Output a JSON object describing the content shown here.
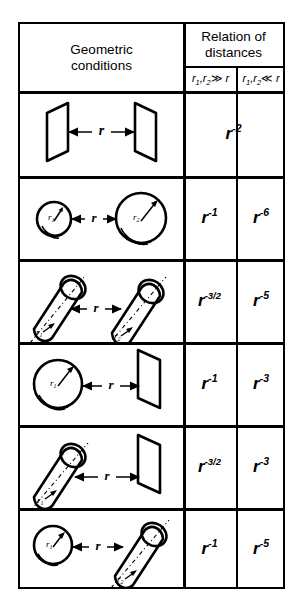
{
  "table": {
    "header": {
      "left_col_line1": "Geometric",
      "left_col_line2": "conditions",
      "right_col_line1": "Relation of",
      "right_col_line2": "distances",
      "sub_col_far": "r₁,r₂ ≫ r",
      "sub_col_near": "r₁,r₂ ≪ r",
      "sub_col_far_parts": {
        "r1": "r",
        "s1": "1",
        "r2": "r",
        "s2": "2",
        "rel": "≫",
        "r": "r"
      },
      "sub_col_near_parts": {
        "r1": "r",
        "s1": "1",
        "r2": "r",
        "s2": "2",
        "rel": "≪",
        "r": "r"
      }
    },
    "rows": [
      {
        "geometry": "plane-plane",
        "geometry_label": "two parallel planes separated by distance r",
        "distance_label": "r",
        "far_base": "r",
        "far_exp": "-2",
        "near_base": "r",
        "near_exp": "-2",
        "merged": true
      },
      {
        "geometry": "sphere-sphere",
        "geometry_label": "two spheres of radii r₁ and r₂ separated by distance r",
        "distance_label": "r",
        "radius_label_1": "r",
        "radius_sub_1": "1",
        "radius_label_2": "r",
        "radius_sub_2": "2",
        "far_base": "r",
        "far_exp": "-1",
        "near_base": "r",
        "near_exp": "-6",
        "merged": false
      },
      {
        "geometry": "cylinder-cylinder",
        "geometry_label": "two parallel cylinders of radii r₁ and r₂ separated by distance r",
        "distance_label": "r",
        "radius_label_1": "r",
        "radius_sub_1": "1",
        "radius_label_2": "r",
        "radius_sub_2": "2",
        "far_base": "r",
        "far_exp": "-3/2",
        "near_base": "r",
        "near_exp": "-5",
        "merged": false
      },
      {
        "geometry": "sphere-plane",
        "geometry_label": "sphere of radius r₁ and a plane separated by distance r",
        "distance_label": "r",
        "radius_label_1": "r",
        "radius_sub_1": "1",
        "far_base": "r",
        "far_exp": "-1",
        "near_base": "r",
        "near_exp": "-3",
        "merged": false
      },
      {
        "geometry": "cylinder-plane",
        "geometry_label": "cylinder of radius r₁ and a plane separated by distance r",
        "distance_label": "r",
        "radius_label_1": "r",
        "radius_sub_1": "1",
        "far_base": "r",
        "far_exp": "-3/2",
        "near_base": "r",
        "near_exp": "-3",
        "merged": false
      },
      {
        "geometry": "sphere-cylinder",
        "geometry_label": "sphere of radius r₁ and cylinder of radius r₂ separated by distance r",
        "distance_label": "r",
        "radius_label_1": "r",
        "radius_sub_1": "1",
        "radius_label_2": "r",
        "radius_sub_2": "2",
        "far_base": "r",
        "far_exp": "-1",
        "near_base": "r",
        "near_exp": "-5",
        "merged": false
      }
    ]
  },
  "colors": {
    "ink": "#000000",
    "paper": "#ffffff"
  }
}
